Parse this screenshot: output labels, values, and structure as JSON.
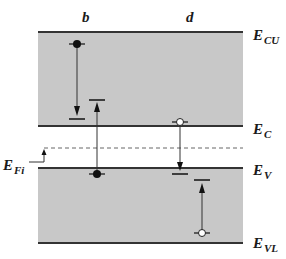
{
  "diagram": {
    "columns": [
      {
        "id": "b",
        "label": "b"
      },
      {
        "id": "d",
        "label": "d"
      }
    ],
    "levels": {
      "E_CU": {
        "main": "E",
        "sub": "CU"
      },
      "E_C": {
        "main": "E",
        "sub": "C"
      },
      "E_Fi": {
        "main": "E",
        "sub": "Fi"
      },
      "E_V": {
        "main": "E",
        "sub": "V"
      },
      "E_VL": {
        "main": "E",
        "sub": "VL"
      }
    },
    "colors": {
      "band_fill": "#c8c8c8",
      "band_edge": "#3a3a3a",
      "line": "#2a2a2a",
      "dashed": "#555555",
      "electron": "#111111",
      "hole_fill": "#ffffff"
    },
    "transitions": [
      {
        "column": "b",
        "carrier": "electron",
        "from": "E_CU band",
        "to": "near E_C",
        "direction": "down"
      },
      {
        "column": "b",
        "carrier": "electron",
        "from": "E_V",
        "to": "E_C band",
        "direction": "up"
      },
      {
        "column": "d",
        "carrier": "hole",
        "from": "E_C",
        "to": "near E_V",
        "direction": "down"
      },
      {
        "column": "d",
        "carrier": "hole",
        "from": "E_VL band",
        "to": "near E_V",
        "direction": "up"
      }
    ]
  }
}
